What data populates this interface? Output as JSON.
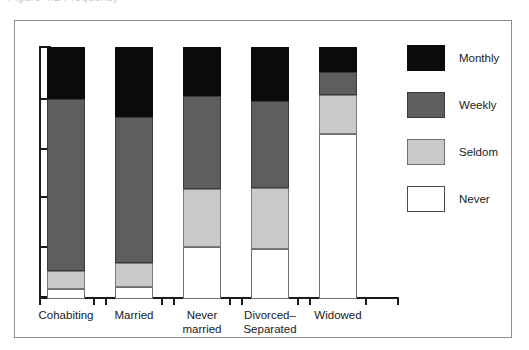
{
  "caption_sliver": "Figure 4.2 Frequency",
  "chart_data": {
    "type": "bar",
    "subtype": "stacked-bar",
    "title": "",
    "xlabel": "",
    "ylabel": "",
    "ylim": [
      0,
      100
    ],
    "grid": false,
    "y_axis_tick_labels": [],
    "y_axis_tick_count": 6,
    "legend_position": "right",
    "stack_order_bottom_to_top": [
      "Never",
      "Seldom",
      "Weekly",
      "Monthly"
    ],
    "categories": [
      "Cohabiting",
      "Married",
      "Never married",
      "Divorced–Separated",
      "Widowed"
    ],
    "category_labels_wrapped": [
      [
        "Cohabiting"
      ],
      [
        "Married"
      ],
      [
        "Never",
        "married"
      ],
      [
        "Divorced–",
        "Separated"
      ],
      [
        "Widowed"
      ]
    ],
    "series": [
      {
        "name": "Monthly",
        "color": "#0b0b0b",
        "values": [
          21,
          28,
          20,
          22,
          10
        ]
      },
      {
        "name": "Weekly",
        "color": "#5e5e5e",
        "values": [
          68,
          58,
          37,
          34,
          9
        ]
      },
      {
        "name": "Seldom",
        "color": "#c9c9c9",
        "values": [
          8,
          10,
          23,
          24,
          16
        ]
      },
      {
        "name": "Never",
        "color": "#ffffff",
        "values": [
          3,
          4,
          20,
          20,
          65
        ]
      }
    ],
    "bars_px": [
      {
        "category": "Cohabiting",
        "x": 32,
        "monthly": [
          26,
          52
        ],
        "weekly": [
          78,
          172
        ],
        "seldom": [
          250,
          18
        ],
        "never": [
          268,
          10
        ]
      },
      {
        "category": "Married",
        "x": 100,
        "monthly": [
          26,
          70
        ],
        "weekly": [
          96,
          146
        ],
        "seldom": [
          242,
          24
        ],
        "never": [
          266,
          12
        ]
      },
      {
        "category": "Never married",
        "x": 168,
        "monthly": [
          26,
          49
        ],
        "weekly": [
          75,
          93
        ],
        "seldom": [
          168,
          58
        ],
        "never": [
          226,
          52
        ]
      },
      {
        "category": "Divorced–Separated",
        "x": 236,
        "monthly": [
          26,
          54
        ],
        "weekly": [
          80,
          87
        ],
        "seldom": [
          167,
          61
        ],
        "never": [
          228,
          50
        ]
      },
      {
        "category": "Widowed",
        "x": 304,
        "monthly": [
          26,
          25
        ],
        "weekly": [
          51,
          23
        ],
        "seldom": [
          74,
          39
        ],
        "never": [
          113,
          165
        ]
      }
    ],
    "y_ticks_px": [
      26,
      78,
      128,
      176,
      226,
      276
    ],
    "x_ticks_px": [
      24,
      78,
      90,
      146,
      158,
      214,
      226,
      282,
      294,
      350,
      382
    ]
  },
  "legend": {
    "items": [
      {
        "label": "Monthly",
        "color": "#0b0b0b",
        "top": 0
      },
      {
        "label": "Weekly",
        "color": "#5e5e5e",
        "top": 47
      },
      {
        "label": "Seldom",
        "color": "#c9c9c9",
        "top": 94
      },
      {
        "label": "Never",
        "color": "#ffffff",
        "top": 141
      }
    ]
  }
}
